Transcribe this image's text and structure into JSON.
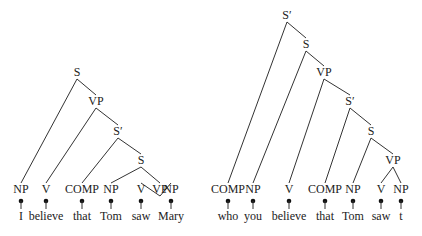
{
  "trees": [
    {
      "name": "declarative",
      "nodes": [
        {
          "label": "S",
          "x": 77,
          "y": 76
        },
        {
          "label": "VP",
          "x": 96,
          "y": 105
        },
        {
          "label": "S′",
          "x": 118,
          "y": 135
        },
        {
          "label": "S",
          "x": 141,
          "y": 164
        },
        {
          "label": "VP",
          "x": 160,
          "y": 193
        }
      ],
      "leaves": [
        {
          "label": "NP",
          "word": "I",
          "x": 21
        },
        {
          "label": "V",
          "word": "believe",
          "x": 46
        },
        {
          "label": "COMP",
          "word": "that",
          "x": 82
        },
        {
          "label": "NP",
          "word": "Tom",
          "x": 111
        },
        {
          "label": "V",
          "word": "saw",
          "x": 141
        },
        {
          "label": "NP",
          "word": "Mary",
          "x": 171
        }
      ],
      "edges": [
        [
          0,
          "L0"
        ],
        [
          0,
          1
        ],
        [
          1,
          "L1"
        ],
        [
          1,
          2
        ],
        [
          2,
          "L2"
        ],
        [
          2,
          3
        ],
        [
          3,
          "L3"
        ],
        [
          3,
          4
        ],
        [
          4,
          "L4"
        ],
        [
          4,
          "L5"
        ]
      ]
    },
    {
      "name": "wh-question",
      "nodes": [
        {
          "label": "S′",
          "x": 287,
          "y": 19
        },
        {
          "label": "S",
          "x": 306,
          "y": 48
        },
        {
          "label": "VP",
          "x": 324,
          "y": 76
        },
        {
          "label": "S′",
          "x": 350,
          "y": 105
        },
        {
          "label": "S",
          "x": 371,
          "y": 135
        },
        {
          "label": "VP",
          "x": 393,
          "y": 164
        }
      ],
      "leaves": [
        {
          "label": "COMP",
          "word": "who",
          "x": 228
        },
        {
          "label": "NP",
          "word": "you",
          "x": 253
        },
        {
          "label": "V",
          "word": "believe",
          "x": 289
        },
        {
          "label": "COMP",
          "word": "that",
          "x": 325
        },
        {
          "label": "NP",
          "word": "Tom",
          "x": 353
        },
        {
          "label": "V",
          "word": "saw",
          "x": 381
        },
        {
          "label": "NP",
          "word": "t",
          "x": 401
        }
      ],
      "edges": [
        [
          0,
          "L0"
        ],
        [
          0,
          1
        ],
        [
          1,
          "L1"
        ],
        [
          1,
          2
        ],
        [
          2,
          "L2"
        ],
        [
          2,
          3
        ],
        [
          3,
          "L3"
        ],
        [
          3,
          4
        ],
        [
          4,
          "L4"
        ],
        [
          4,
          5
        ],
        [
          5,
          "L5"
        ],
        [
          5,
          "L6"
        ]
      ]
    }
  ]
}
